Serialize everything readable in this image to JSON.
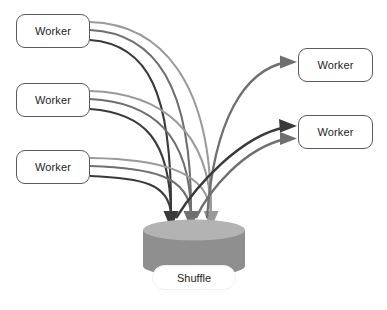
{
  "diagram": {
    "background_color": "#ffffff"
  },
  "nodes": {
    "source_workers": [
      {
        "id": "worker-src-1",
        "label": "Worker",
        "x": 16,
        "y": 14,
        "w": 74,
        "h": 34
      },
      {
        "id": "worker-src-2",
        "label": "Worker",
        "x": 16,
        "y": 83,
        "w": 74,
        "h": 34
      },
      {
        "id": "worker-src-3",
        "label": "Worker",
        "x": 16,
        "y": 150,
        "w": 74,
        "h": 34
      }
    ],
    "target_workers": [
      {
        "id": "worker-dst-1",
        "label": "Worker",
        "x": 298,
        "y": 48,
        "w": 75,
        "h": 34
      },
      {
        "id": "worker-dst-2",
        "label": "Worker",
        "x": 298,
        "y": 115,
        "w": 75,
        "h": 34
      }
    ],
    "shuffle": {
      "id": "shuffle-store",
      "label": "Shuffle",
      "cylinder": {
        "cx": 194,
        "top_y": 230,
        "rx": 51,
        "ry": 10,
        "body_h": 36
      },
      "label_box": {
        "x": 152,
        "y": 265,
        "w": 84,
        "h": 25
      }
    }
  },
  "colors": {
    "line_dark": "#3a3a3a",
    "line_mid": "#6f6f6f",
    "line_light": "#9a9a9a",
    "cylinder_top": "#b3b3b3",
    "cylinder_body": "#8f8f8f",
    "box_border": "#5a5a5a",
    "text": "#1d1d1d"
  },
  "edges": {
    "inbound": [
      {
        "from": "worker-src-1",
        "to": "shuffle-store",
        "shade": "line_light",
        "arrow_index": 2
      },
      {
        "from": "worker-src-1",
        "to": "shuffle-store",
        "shade": "line_mid",
        "arrow_index": 1
      },
      {
        "from": "worker-src-1",
        "to": "shuffle-store",
        "shade": "line_dark",
        "arrow_index": 0
      },
      {
        "from": "worker-src-2",
        "to": "shuffle-store",
        "shade": "line_light",
        "arrow_index": 2
      },
      {
        "from": "worker-src-2",
        "to": "shuffle-store",
        "shade": "line_mid",
        "arrow_index": 1
      },
      {
        "from": "worker-src-2",
        "to": "shuffle-store",
        "shade": "line_dark",
        "arrow_index": 0
      },
      {
        "from": "worker-src-3",
        "to": "shuffle-store",
        "shade": "line_light",
        "arrow_index": 2
      },
      {
        "from": "worker-src-3",
        "to": "shuffle-store",
        "shade": "line_mid",
        "arrow_index": 1
      },
      {
        "from": "worker-src-3",
        "to": "shuffle-store",
        "shade": "line_dark",
        "arrow_index": 0
      }
    ],
    "outbound": [
      {
        "from": "shuffle-store",
        "to": "worker-dst-1",
        "shade": "line_mid"
      },
      {
        "from": "shuffle-store",
        "to": "worker-dst-2",
        "shade": "line_dark"
      },
      {
        "from": "shuffle-store",
        "to": "worker-dst-2",
        "shade": "line_mid"
      }
    ],
    "down_arrow_tips": [
      {
        "x": 170,
        "y": 228,
        "shade": "line_dark"
      },
      {
        "x": 190,
        "y": 228,
        "shade": "line_mid"
      },
      {
        "x": 210,
        "y": 228,
        "shade": "line_light"
      }
    ]
  }
}
